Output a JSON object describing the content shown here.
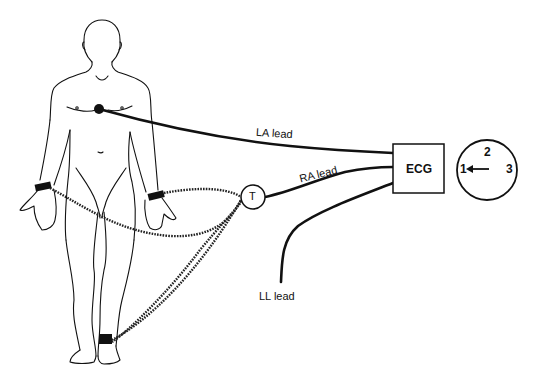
{
  "diagram": {
    "type": "ECG lead connection illustration",
    "colors": {
      "ink": "#111111",
      "background": "#ffffff"
    },
    "figure": {
      "description": "human figure, front view, with chest electrode, two wrist bands and an ankle band"
    },
    "leads": {
      "la": {
        "label": "LA lead"
      },
      "ra": {
        "label": "RA lead"
      },
      "ll": {
        "label": "LL lead"
      }
    },
    "junction": {
      "label": "T"
    },
    "device": {
      "label": "ECG"
    },
    "dial": {
      "numbers": [
        "1",
        "2",
        "3"
      ],
      "pointer": "arrow pointing to 1"
    }
  }
}
